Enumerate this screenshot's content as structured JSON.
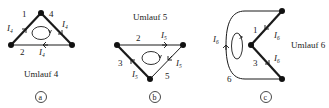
{
  "diagrams": [
    {
      "id": "a",
      "title": "Umlauf 4",
      "badge": "a",
      "branches": [
        {
          "num": "1",
          "current": "I",
          "current_sub": "4"
        },
        {
          "num": "4",
          "current": "I",
          "current_sub": "4"
        },
        {
          "num": "2",
          "current": "I",
          "current_sub": "4"
        }
      ]
    },
    {
      "id": "b",
      "title": "Umlauf 5",
      "badge": "b",
      "branches": [
        {
          "num": "2",
          "current": "I",
          "current_sub": "5"
        },
        {
          "num": "5",
          "current": "I",
          "current_sub": "5"
        },
        {
          "num": "3",
          "current": "I",
          "current_sub": "5"
        }
      ]
    },
    {
      "id": "c",
      "title": "Umlauf 6",
      "badge": "c",
      "branches": [
        {
          "num": "1",
          "current": "I",
          "current_sub": "6"
        },
        {
          "num": "3",
          "current": "I",
          "current_sub": "6"
        },
        {
          "num": "6",
          "current": "I",
          "current_sub": "6"
        }
      ]
    }
  ],
  "colors": {
    "line": "#1a1a1a",
    "node": "#111111",
    "background": "#ffffff"
  }
}
